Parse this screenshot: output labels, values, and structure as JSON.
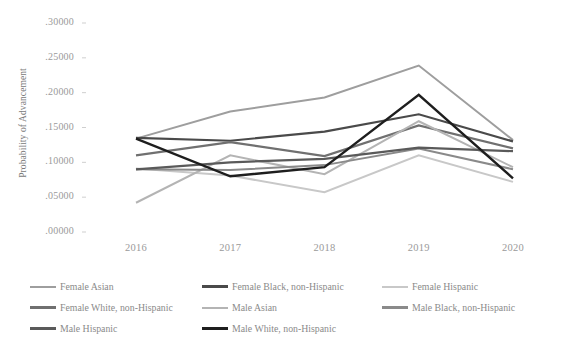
{
  "chart_data": {
    "type": "line",
    "title": "",
    "xlabel": "",
    "ylabel": "Probability of Advancement",
    "categories": [
      "2016",
      "2017",
      "2018",
      "2019",
      "2020"
    ],
    "x_tick_labels": [
      "2016",
      "2017",
      "2018",
      "2019",
      "2020"
    ],
    "y_tick_labels": [
      ".30000",
      ".25000",
      ".20000",
      ".15000",
      ".10000",
      ".05000",
      ".00000"
    ],
    "y_tick_values": [
      0.3,
      0.25,
      0.2,
      0.15,
      0.1,
      0.05,
      0.0
    ],
    "ylim": [
      0.0,
      0.3
    ],
    "grid": false,
    "legend_position": "bottom",
    "series": [
      {
        "name": "Female Asian",
        "color": "#9e9e9e",
        "width": 2.0,
        "values": [
          0.134,
          0.173,
          0.193,
          0.239,
          0.132
        ]
      },
      {
        "name": "Female Black, non-Hispanic",
        "color": "#4a4a4a",
        "width": 2.2,
        "values": [
          0.135,
          0.131,
          0.144,
          0.169,
          0.13
        ]
      },
      {
        "name": "Female Hispanic",
        "color": "#c8c8c8",
        "width": 2.0,
        "values": [
          0.091,
          0.081,
          0.057,
          0.11,
          0.072
        ]
      },
      {
        "name": "Female White, non-Hispanic",
        "color": "#707070",
        "width": 2.2,
        "values": [
          0.11,
          0.129,
          0.109,
          0.153,
          0.12
        ]
      },
      {
        "name": "Male Asian",
        "color": "#b4b4b4",
        "width": 2.0,
        "values": [
          0.042,
          0.11,
          0.083,
          0.159,
          0.093
        ]
      },
      {
        "name": "Male Black, non-Hispanic",
        "color": "#8a8a8a",
        "width": 2.0,
        "values": [
          0.09,
          0.089,
          0.096,
          0.12,
          0.09
        ]
      },
      {
        "name": "Male Hispanic",
        "color": "#5a5a5a",
        "width": 2.2,
        "values": [
          0.09,
          0.1,
          0.105,
          0.121,
          0.116
        ]
      },
      {
        "name": "Male White, non-Hispanic",
        "color": "#1e1e1e",
        "width": 2.4,
        "values": [
          0.134,
          0.08,
          0.093,
          0.197,
          0.077
        ]
      }
    ]
  },
  "axis": {
    "ylabel": "Probability of Advancement"
  },
  "legend": {
    "rows": [
      [
        {
          "label": "Female Asian",
          "color": "#9e9e9e",
          "width": 2.0
        },
        {
          "label": "Female Black, non-Hispanic",
          "color": "#4a4a4a",
          "width": 2.6
        },
        {
          "label": "Female Hispanic",
          "color": "#c8c8c8",
          "width": 2.0
        }
      ],
      [
        {
          "label": "Female White, non-Hispanic",
          "color": "#707070",
          "width": 2.4
        },
        {
          "label": "Male Asian",
          "color": "#b4b4b4",
          "width": 2.0
        },
        {
          "label": "Male Black, non-Hispanic",
          "color": "#8a8a8a",
          "width": 2.2
        }
      ],
      [
        {
          "label": "Male Hispanic",
          "color": "#5a5a5a",
          "width": 2.6
        },
        {
          "label": "Male White, non-Hispanic",
          "color": "#1e1e1e",
          "width": 2.8
        }
      ]
    ]
  }
}
